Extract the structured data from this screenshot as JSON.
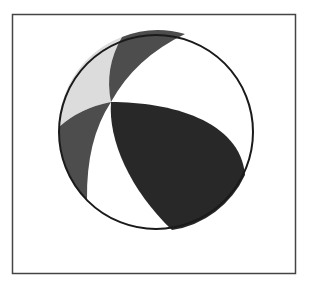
{
  "diagram": {
    "type": "beach-ball",
    "frame": {
      "x": 12,
      "y": 14,
      "width": 283,
      "height": 259,
      "stroke": "#444444"
    },
    "circle": {
      "cx": 156,
      "cy": 132,
      "r": 97,
      "stroke": "#1a1a1a"
    },
    "colors": {
      "light_gray": "#dcdcdc",
      "dark_gray": "#4d4d4d",
      "black": "#282828",
      "white": "#ffffff"
    },
    "regions": [
      {
        "name": "light-gray-wedge",
        "fill": "#dcdcdc"
      },
      {
        "name": "top-dark-gray-wedge",
        "fill": "#4d4d4d"
      },
      {
        "name": "left-dark-gray-wedge",
        "fill": "#4d4d4d"
      },
      {
        "name": "black-lobe",
        "fill": "#282828"
      }
    ]
  }
}
